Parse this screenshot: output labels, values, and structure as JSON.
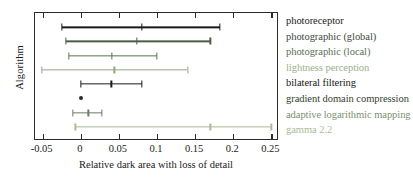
{
  "chart_data": {
    "type": "bar",
    "orientation": "horizontal",
    "title": "",
    "xlabel": "Relative dark area with loss of detail",
    "ylabel": "Algorithm",
    "xlim": [
      -0.06,
      0.26
    ],
    "xticks": [
      "-0.05",
      "0",
      "0.05",
      "0.1",
      "0.15",
      "0.2",
      "0.25"
    ],
    "xtick_values": [
      -0.05,
      0,
      0.05,
      0.1,
      0.15,
      0.2,
      0.25
    ],
    "grid": false,
    "legend_position": "right",
    "categories": [
      "photoreceptor",
      "photographic (global)",
      "photographic (local)",
      "lightness perception",
      "bilateral filtering",
      "gradient domain compression",
      "adaptive logarithmic mapping",
      "gamma 2.2"
    ],
    "series": [
      {
        "name": "photoreceptor",
        "low": -0.025,
        "mid": 0.08,
        "high": 0.182,
        "color": "#1a1a1a",
        "has_interval": true
      },
      {
        "name": "photographic (global)",
        "low": -0.02,
        "mid": 0.074,
        "high": 0.17,
        "color": "#4a5f46",
        "has_interval": true
      },
      {
        "name": "photographic (local)",
        "low": -0.016,
        "mid": 0.041,
        "high": 0.1,
        "color": "#5b7053",
        "has_interval": true
      },
      {
        "name": "lightness perception",
        "low": -0.051,
        "mid": 0.044,
        "high": 0.14,
        "color": "#93a882",
        "has_interval": true
      },
      {
        "name": "bilateral filtering",
        "low": 0.0,
        "mid": 0.04,
        "high": 0.08,
        "color": "#1a1a1a",
        "has_interval": true
      },
      {
        "name": "gradient domain compression",
        "low": 0.0,
        "mid": 0.0,
        "high": 0.0,
        "color": "#2b2b2b",
        "has_interval": false
      },
      {
        "name": "adaptive logarithmic mapping",
        "low": -0.01,
        "mid": 0.01,
        "high": 0.028,
        "color": "#6e7b63",
        "has_interval": true
      },
      {
        "name": "gamma 2.2",
        "low": -0.007,
        "mid": 0.17,
        "high": 0.25,
        "color": "#a8bb95",
        "has_interval": true
      }
    ]
  },
  "legend": {
    "items": [
      {
        "label": "photoreceptor",
        "color": "#1a1a1a"
      },
      {
        "label": "photographic (global)",
        "color": "#3b4a39"
      },
      {
        "label": "photographic (local)",
        "color": "#5b7053"
      },
      {
        "label": "lightness perception",
        "color": "#9cb08c"
      },
      {
        "label": "bilateral filtering",
        "color": "#161616"
      },
      {
        "label": "gradient domain compression",
        "color": "#33422f"
      },
      {
        "label": "adaptive logarithmic mapping",
        "color": "#7d8f72"
      },
      {
        "label": "gamma 2.2",
        "color": "#a9bc98"
      }
    ]
  }
}
